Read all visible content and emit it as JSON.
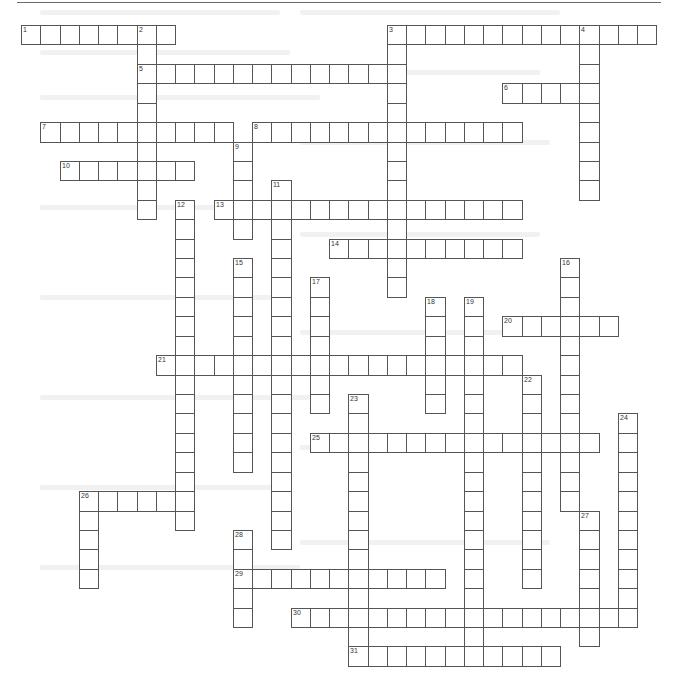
{
  "puzzle": {
    "type": "crossword",
    "grid_origin": {
      "x": 21,
      "y": 25
    },
    "cell_size": {
      "w": 19.25,
      "h": 19.42
    },
    "border_color": "#555555",
    "cell_fill": "#ffffff"
  },
  "words": [
    {
      "number": 1,
      "direction": "across",
      "row": 0,
      "col": 0,
      "length": 8
    },
    {
      "number": 2,
      "direction": "down",
      "row": 0,
      "col": 6,
      "length": 10
    },
    {
      "number": 3,
      "direction": "across",
      "row": 0,
      "col": 19,
      "length": 14
    },
    {
      "number": 3,
      "direction": "down",
      "row": 0,
      "col": 19,
      "length": 14
    },
    {
      "number": 4,
      "direction": "down",
      "row": 0,
      "col": 29,
      "length": 9
    },
    {
      "number": 5,
      "direction": "across",
      "row": 2,
      "col": 6,
      "length": 14
    },
    {
      "number": 6,
      "direction": "across",
      "row": 3,
      "col": 25,
      "length": 5
    },
    {
      "number": 7,
      "direction": "across",
      "row": 5,
      "col": 1,
      "length": 10
    },
    {
      "number": 8,
      "direction": "across",
      "row": 5,
      "col": 12,
      "length": 14
    },
    {
      "number": 9,
      "direction": "down",
      "row": 6,
      "col": 11,
      "length": 5
    },
    {
      "number": 10,
      "direction": "across",
      "row": 7,
      "col": 2,
      "length": 7
    },
    {
      "number": 11,
      "direction": "down",
      "row": 8,
      "col": 13,
      "length": 19
    },
    {
      "number": 12,
      "direction": "down",
      "row": 9,
      "col": 8,
      "length": 17
    },
    {
      "number": 13,
      "direction": "across",
      "row": 9,
      "col": 10,
      "length": 16
    },
    {
      "number": 14,
      "direction": "across",
      "row": 11,
      "col": 16,
      "length": 10
    },
    {
      "number": 15,
      "direction": "down",
      "row": 12,
      "col": 11,
      "length": 11
    },
    {
      "number": 16,
      "direction": "down",
      "row": 12,
      "col": 28,
      "length": 13
    },
    {
      "number": 17,
      "direction": "down",
      "row": 13,
      "col": 15,
      "length": 7
    },
    {
      "number": 18,
      "direction": "down",
      "row": 14,
      "col": 21,
      "length": 6
    },
    {
      "number": 19,
      "direction": "down",
      "row": 14,
      "col": 23,
      "length": 19
    },
    {
      "number": 20,
      "direction": "across",
      "row": 15,
      "col": 25,
      "length": 6
    },
    {
      "number": 21,
      "direction": "across",
      "row": 17,
      "col": 7,
      "length": 19
    },
    {
      "number": 22,
      "direction": "down",
      "row": 18,
      "col": 26,
      "length": 11
    },
    {
      "number": 23,
      "direction": "down",
      "row": 19,
      "col": 17,
      "length": 14
    },
    {
      "number": 24,
      "direction": "down",
      "row": 20,
      "col": 31,
      "length": 11
    },
    {
      "number": 25,
      "direction": "across",
      "row": 21,
      "col": 15,
      "length": 15
    },
    {
      "number": 26,
      "direction": "across",
      "row": 24,
      "col": 3,
      "length": 6
    },
    {
      "number": 26,
      "direction": "down",
      "row": 24,
      "col": 3,
      "length": 5
    },
    {
      "number": 27,
      "direction": "down",
      "row": 25,
      "col": 29,
      "length": 7
    },
    {
      "number": 28,
      "direction": "down",
      "row": 26,
      "col": 11,
      "length": 5
    },
    {
      "number": 29,
      "direction": "across",
      "row": 28,
      "col": 11,
      "length": 11
    },
    {
      "number": 30,
      "direction": "across",
      "row": 30,
      "col": 14,
      "length": 18
    },
    {
      "number": 31,
      "direction": "across",
      "row": 32,
      "col": 17,
      "length": 11
    }
  ]
}
